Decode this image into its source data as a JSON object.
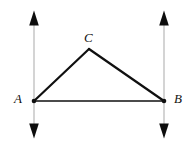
{
  "figure": {
    "type": "geometry-diagram",
    "background_color": "#ffffff",
    "canvas": {
      "width": 194,
      "height": 146
    },
    "labels": {
      "A": "A",
      "B": "B",
      "C": "C"
    },
    "points": {
      "A": {
        "x": 34,
        "y": 101
      },
      "B": {
        "x": 164,
        "y": 101
      },
      "C": {
        "x": 89,
        "y": 49
      }
    },
    "segments": [
      {
        "name": "segment-AC",
        "from": "A",
        "to": "C",
        "color": "#101010",
        "width": 2.2
      },
      {
        "name": "segment-CB",
        "from": "C",
        "to": "B",
        "color": "#101010",
        "width": 2.2
      },
      {
        "name": "segment-AB",
        "from": "A",
        "to": "B",
        "color": "#101010",
        "width": 1.6
      }
    ],
    "vertical_lines": [
      {
        "name": "vertical-line-through-A",
        "x": 34,
        "top": 11,
        "bottom": 138,
        "color": "#b8b8b8",
        "width": 1.2,
        "arrowheads": [
          "up",
          "down"
        ],
        "arrow_color": "#0d0d0d"
      },
      {
        "name": "vertical-line-through-B",
        "x": 164,
        "top": 11,
        "bottom": 138,
        "color": "#b8b8b8",
        "width": 1.2,
        "arrowheads": [
          "up",
          "down"
        ],
        "arrow_color": "#0d0d0d"
      }
    ],
    "vertex_dots": [
      {
        "name": "vertex-dot-A",
        "x": 34,
        "y": 101,
        "r": 2.3,
        "color": "#101010"
      },
      {
        "name": "vertex-dot-B",
        "x": 164,
        "y": 101,
        "r": 2.3,
        "color": "#101010"
      }
    ],
    "colors": {
      "stroke": "#101010",
      "guide_line": "#b8b8b8",
      "arrow": "#0d0d0d",
      "label": "#111111"
    }
  }
}
